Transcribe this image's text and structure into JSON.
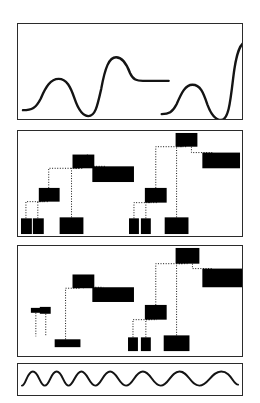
{
  "figure": {
    "title": "",
    "background_color": "#ffffff",
    "stroke_color": "#141414",
    "bar_color": "#000000",
    "panel_count": 4
  },
  "panels": [
    {
      "id": "panel-waveform-top",
      "name": "waveform-panel-top",
      "x": 17,
      "y": 23,
      "width": 226,
      "height": 97,
      "type": "curve",
      "curves": [
        {
          "name": "left-sigmoid-wave",
          "points": "M 5,88 C 14,88 18,86 23,76 C 28,64 33,56 41,56 C 49,56 53,64 57,76 C 61,88 65,94 71,94 C 78,94 80,84 84,66 C 88,44 92,34 99,34 C 106,34 110,42 113,50 C 116,57 120,58 126,58 L 152,58"
        },
        {
          "name": "right-sigmoid-wave",
          "points": "M 145,92 C 152,92 156,90 160,82 C 165,70 169,62 176,62 C 184,62 187,70 191,82 C 195,93 199,98 205,98 C 212,98 214,82 217,56 C 220,30 224,18 231,18 C 238,18 241,27 244,36 C 246,43 250,44 256,44 L 286,44"
        }
      ]
    },
    {
      "id": "panel-dendrogram-upper",
      "name": "dendrogram-panel-upper",
      "x": 17,
      "y": 130,
      "width": 226,
      "height": 107,
      "type": "dendrogram",
      "bars": [
        {
          "name": "bar-leaf-1",
          "x": 3,
          "y": 89,
          "w": 11,
          "h": 16
        },
        {
          "name": "bar-leaf-2",
          "x": 15,
          "y": 89,
          "w": 11,
          "h": 16
        },
        {
          "name": "bar-node-a",
          "x": 21,
          "y": 58,
          "w": 21,
          "h": 14
        },
        {
          "name": "bar-leaf-3",
          "x": 42,
          "y": 88,
          "w": 24,
          "h": 17
        },
        {
          "name": "bar-node-b",
          "x": 55,
          "y": 24,
          "w": 22,
          "h": 14
        },
        {
          "name": "bar-node-c",
          "x": 75,
          "y": 36,
          "w": 42,
          "h": 16
        },
        {
          "name": "bar-leaf-4",
          "x": 112,
          "y": 89,
          "w": 10,
          "h": 16
        },
        {
          "name": "bar-leaf-5",
          "x": 124,
          "y": 89,
          "w": 10,
          "h": 16
        },
        {
          "name": "bar-node-d",
          "x": 128,
          "y": 58,
          "w": 22,
          "h": 15
        },
        {
          "name": "bar-leaf-6",
          "x": 148,
          "y": 88,
          "w": 24,
          "h": 17
        },
        {
          "name": "bar-node-e",
          "x": 159,
          "y": 2,
          "w": 22,
          "h": 14
        },
        {
          "name": "bar-node-f",
          "x": 186,
          "y": 22,
          "w": 38,
          "h": 16
        }
      ],
      "links": [
        {
          "name": "link-leaf1-nodea",
          "from": [
            8,
            89
          ],
          "to": [
            26,
            72
          ]
        },
        {
          "name": "link-leaf2-nodea",
          "from": [
            20,
            89
          ],
          "to": [
            31,
            72
          ]
        },
        {
          "name": "link-nodea-nodeb",
          "from": [
            31,
            58
          ],
          "to": [
            62,
            38
          ]
        },
        {
          "name": "link-leaf3-nodeb",
          "from": [
            54,
            88
          ],
          "to": [
            66,
            38
          ]
        },
        {
          "name": "link-nodeb-nodec",
          "from": [
            70,
            24
          ],
          "to": [
            88,
            36
          ]
        },
        {
          "name": "link-leaf4-noded",
          "from": [
            117,
            89
          ],
          "to": [
            134,
            73
          ]
        },
        {
          "name": "link-leaf5-noded",
          "from": [
            129,
            89
          ],
          "to": [
            140,
            73
          ]
        },
        {
          "name": "link-noded-nodee",
          "from": [
            139,
            58
          ],
          "to": [
            166,
            16
          ]
        },
        {
          "name": "link-leaf6-nodee",
          "from": [
            160,
            88
          ],
          "to": [
            170,
            16
          ]
        },
        {
          "name": "link-nodee-nodef",
          "from": [
            175,
            16
          ],
          "to": [
            196,
            22
          ]
        }
      ]
    },
    {
      "id": "panel-dendrogram-lower",
      "name": "dendrogram-panel-lower",
      "x": 17,
      "y": 245,
      "width": 226,
      "height": 112,
      "type": "dendrogram",
      "bars": [
        {
          "name": "bar-small-leaf-1",
          "x": 13,
          "y": 63,
          "w": 10,
          "h": 5
        },
        {
          "name": "bar-small-leaf-2",
          "x": 22,
          "y": 62,
          "w": 11,
          "h": 7
        },
        {
          "name": "bar-leaf-base-1",
          "x": 37,
          "y": 95,
          "w": 26,
          "h": 8
        },
        {
          "name": "bar-node-a",
          "x": 55,
          "y": 29,
          "w": 22,
          "h": 14
        },
        {
          "name": "bar-node-b",
          "x": 75,
          "y": 42,
          "w": 42,
          "h": 15
        },
        {
          "name": "bar-leaf-4",
          "x": 111,
          "y": 93,
          "w": 10,
          "h": 14
        },
        {
          "name": "bar-leaf-5",
          "x": 124,
          "y": 93,
          "w": 10,
          "h": 14
        },
        {
          "name": "bar-node-d",
          "x": 128,
          "y": 60,
          "w": 22,
          "h": 15
        },
        {
          "name": "bar-leaf-6",
          "x": 147,
          "y": 91,
          "w": 26,
          "h": 16
        },
        {
          "name": "bar-node-e",
          "x": 159,
          "y": 2,
          "w": 24,
          "h": 16
        },
        {
          "name": "bar-node-f",
          "x": 186,
          "y": 23,
          "w": 40,
          "h": 19
        }
      ],
      "links": [
        {
          "name": "link-small1-down",
          "from": [
            18,
            68
          ],
          "to": [
            18,
            92
          ]
        },
        {
          "name": "link-small2-down",
          "from": [
            28,
            69
          ],
          "to": [
            28,
            92
          ]
        },
        {
          "name": "link-base-nodea",
          "from": [
            48,
            95
          ],
          "to": [
            62,
            43
          ]
        },
        {
          "name": "link-nodea-nodeb",
          "from": [
            66,
            43
          ],
          "to": [
            86,
            42
          ]
        },
        {
          "name": "link-leaf4-noded",
          "from": [
            116,
            93
          ],
          "to": [
            134,
            75
          ]
        },
        {
          "name": "link-leaf5-noded",
          "from": [
            129,
            93
          ],
          "to": [
            140,
            75
          ]
        },
        {
          "name": "link-noded-nodee",
          "from": [
            139,
            60
          ],
          "to": [
            166,
            18
          ]
        },
        {
          "name": "link-leaf6-nodee",
          "from": [
            160,
            91
          ],
          "to": [
            171,
            18
          ]
        },
        {
          "name": "link-nodee-nodef",
          "from": [
            176,
            18
          ],
          "to": [
            197,
            23
          ]
        }
      ]
    },
    {
      "id": "panel-sine-strip",
      "name": "sine-wave-panel",
      "x": 17,
      "y": 363,
      "width": 226,
      "height": 33,
      "type": "sine",
      "peak_count": 7,
      "curve": {
        "name": "chirp-sine-wave",
        "points": "M 4,23 C 8,23 9,8 15,8 C 21,8 22,23 27,23 C 32,23 33,8 39,8 C 45,8 46,23 51,23 C 56,23 58,8 64,8 C 70,8 72,23 78,23 C 84,23 86,8 93,8 C 100,8 102,23 109,23 C 116,23 118,8 126,8 C 134,8 136,23 144,23 C 152,23 154,8 163,8 C 172,8 174,23 183,23 C 192,23 195,8 205,8 C 215,8 217,22 222,22"
      }
    }
  ]
}
